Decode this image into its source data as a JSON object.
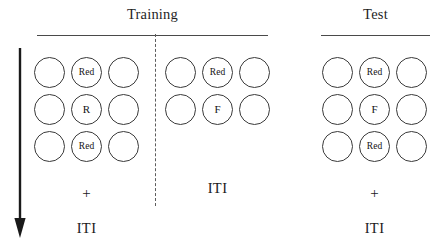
{
  "figure": {
    "width": 439,
    "height": 248,
    "background": "#ffffff",
    "stroke_color": "#3a3a3a",
    "text_color": "#1a1a1a"
  },
  "time_arrow": {
    "name": "time-arrow",
    "direction": "downward",
    "meaning": "time"
  },
  "phase_divider": {
    "style": "dashed",
    "separates": "training-trial-1 from training-trial-2"
  },
  "headers": [
    {
      "id": "training",
      "label": "Training",
      "title_x": 152,
      "title_y": 6,
      "rule_x": 37,
      "rule_y": 35,
      "rule_w": 231
    },
    {
      "id": "test",
      "label": "Test",
      "title_x": 375,
      "title_y": 6,
      "rule_x": 321,
      "rule_y": 35,
      "rule_w": 109
    }
  ],
  "panels": [
    {
      "id": "training-trial-1",
      "phase": "Training",
      "grid_x": 34,
      "grid_y": 57,
      "rows": [
        {
          "cells": [
            {
              "label": "",
              "kind": "empty"
            },
            {
              "label": "Red",
              "kind": "word"
            },
            {
              "label": "",
              "kind": "empty"
            }
          ]
        },
        {
          "cells": [
            {
              "label": "",
              "kind": "empty"
            },
            {
              "label": "R",
              "kind": "letter"
            },
            {
              "label": "",
              "kind": "empty"
            }
          ]
        },
        {
          "cells": [
            {
              "label": "",
              "kind": "empty"
            },
            {
              "label": "Red",
              "kind": "word"
            },
            {
              "label": "",
              "kind": "empty"
            }
          ]
        }
      ],
      "fixation": {
        "label": "+",
        "x": 34,
        "y": 186,
        "width": 105
      },
      "iti": {
        "label": "ITI",
        "x": 34,
        "y": 221,
        "width": 105
      }
    },
    {
      "id": "training-trial-2",
      "phase": "Training",
      "grid_x": 165,
      "grid_y": 57,
      "rows": [
        {
          "cells": [
            {
              "label": "",
              "kind": "empty"
            },
            {
              "label": "Red",
              "kind": "word"
            },
            {
              "label": "",
              "kind": "empty"
            }
          ]
        },
        {
          "cells": [
            {
              "label": "",
              "kind": "empty"
            },
            {
              "label": "F",
              "kind": "letter"
            },
            {
              "label": "",
              "kind": "empty"
            }
          ]
        }
      ],
      "fixation": null,
      "iti": {
        "label": "ITI",
        "x": 165,
        "y": 181,
        "width": 105
      }
    },
    {
      "id": "test-trial",
      "phase": "Test",
      "grid_x": 322,
      "grid_y": 57,
      "rows": [
        {
          "cells": [
            {
              "label": "",
              "kind": "empty"
            },
            {
              "label": "Red",
              "kind": "word"
            },
            {
              "label": "",
              "kind": "empty"
            }
          ]
        },
        {
          "cells": [
            {
              "label": "",
              "kind": "empty"
            },
            {
              "label": "F",
              "kind": "letter"
            },
            {
              "label": "",
              "kind": "empty"
            }
          ]
        },
        {
          "cells": [
            {
              "label": "",
              "kind": "empty"
            },
            {
              "label": "Red",
              "kind": "word"
            },
            {
              "label": "",
              "kind": "empty"
            }
          ]
        }
      ],
      "fixation": {
        "label": "+",
        "x": 322,
        "y": 186,
        "width": 105
      },
      "iti": {
        "label": "ITI",
        "x": 322,
        "y": 221,
        "width": 105
      }
    }
  ]
}
